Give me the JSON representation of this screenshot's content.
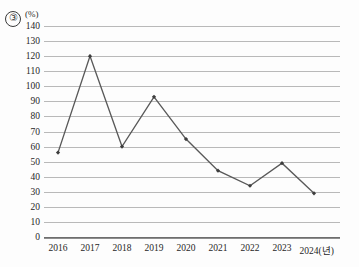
{
  "figure": {
    "item_number": "③",
    "unit_label": "(%)"
  },
  "chart_data": {
    "type": "line",
    "title": "",
    "xlabel": "2024(년)",
    "ylabel": "(%)",
    "categories": [
      "2016",
      "2017",
      "2018",
      "2019",
      "2020",
      "2021",
      "2022",
      "2023",
      "2024(년)"
    ],
    "x": [
      2016,
      2017,
      2018,
      2019,
      2020,
      2021,
      2022,
      2023,
      2024
    ],
    "values": [
      56,
      120,
      60,
      93,
      65,
      44,
      34,
      49,
      29
    ],
    "series": [
      {
        "name": "",
        "values": [
          56,
          120,
          60,
          93,
          65,
          44,
          34,
          49,
          29
        ]
      }
    ],
    "ylim": [
      0,
      140
    ],
    "ytick_values": [
      0,
      10,
      20,
      30,
      40,
      50,
      60,
      70,
      80,
      90,
      100,
      110,
      120,
      130,
      140
    ],
    "ytick_labels": [
      "0",
      "10",
      "20",
      "30",
      "40",
      "50",
      "60",
      "70",
      "80",
      "90",
      "100",
      "110",
      "120",
      "130",
      "140"
    ],
    "grid": true,
    "legend": "none",
    "line_color": "#595959",
    "marker_color": "#3d3d3d",
    "grid_color": "#b9b9b9",
    "axis_color": "#6e6e6e"
  }
}
